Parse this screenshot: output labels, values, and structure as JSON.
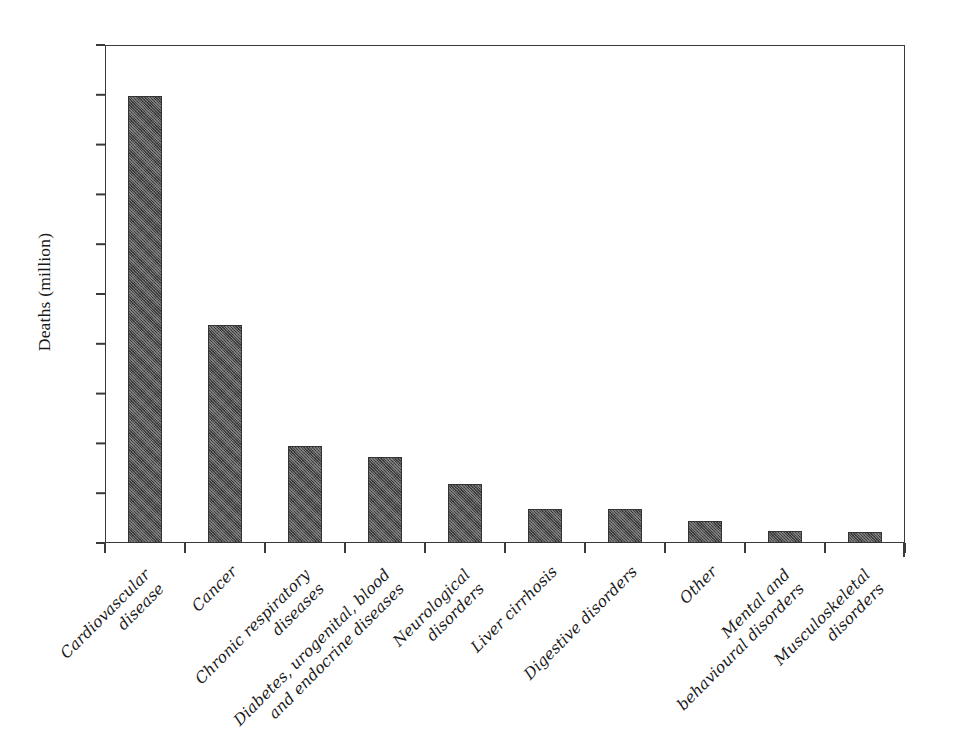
{
  "chart_data": {
    "type": "bar",
    "title": "",
    "subtitle": "",
    "xlabel": "",
    "ylabel": "Deaths (million)",
    "ylim": [
      0,
      20
    ],
    "ytick_step": 2,
    "yticks": [
      "20",
      "18",
      "16",
      "14",
      "12",
      "10",
      "8",
      "6",
      "4",
      "2",
      "0"
    ],
    "grid": false,
    "legend": false,
    "legend_position": "none",
    "bar_color": "#4d4d4d",
    "categories": [
      "Cardiovascular disease",
      "Cancer",
      "Chronic respiratory diseases",
      "Diabetes, urogenital, blood and endocrine diseases",
      "Neurological disorders",
      "Liver cirrhosis",
      "Digestive disorders",
      "Other",
      "Mental and behavioural disorders",
      "Musculoskeletal disorders"
    ],
    "category_label_lines": [
      [
        "Cardiovascular",
        "disease"
      ],
      [
        "Cancer"
      ],
      [
        "Chronic respiratory",
        "diseases"
      ],
      [
        "Diabetes, urogenital, blood",
        "and endocrine diseases"
      ],
      [
        "Neurological",
        "disorders"
      ],
      [
        "Liver cirrhosis"
      ],
      [
        "Digestive disorders"
      ],
      [
        "Other"
      ],
      [
        "Mental and",
        "behavioural disorders"
      ],
      [
        "Musculoskeletal",
        "disorders"
      ]
    ],
    "values": [
      17.95,
      8.75,
      3.9,
      3.45,
      2.35,
      1.35,
      1.35,
      0.9,
      0.5,
      0.45
    ]
  }
}
